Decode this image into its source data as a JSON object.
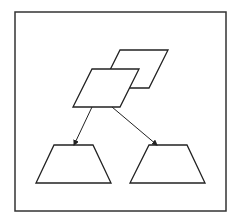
{
  "diagram": {
    "stroke_color": "#222222",
    "border_color": "#333333",
    "background": "#ffffff",
    "frame": {
      "x": 15,
      "y": 12,
      "width": 211,
      "height": 199
    },
    "shapes": [
      {
        "id": "parallelogram-back",
        "type": "parallelogram",
        "points": "120,50 168,50 149,88 101,88"
      },
      {
        "id": "parallelogram-front",
        "type": "parallelogram",
        "points": "92,69 139,69 120,107 73,107"
      },
      {
        "id": "trapezoid-left",
        "type": "trapezoid",
        "points": "54,145 93,145 111,183 36,183"
      },
      {
        "id": "trapezoid-right",
        "type": "trapezoid",
        "points": "149,145 187,145 205,183 130,183"
      }
    ],
    "arrows": [
      {
        "id": "arrow-to-left",
        "from": [
          92,
          107
        ],
        "to": [
          74,
          145
        ]
      },
      {
        "id": "arrow-to-right",
        "from": [
          112,
          107
        ],
        "to": [
          157,
          145
        ]
      }
    ]
  }
}
